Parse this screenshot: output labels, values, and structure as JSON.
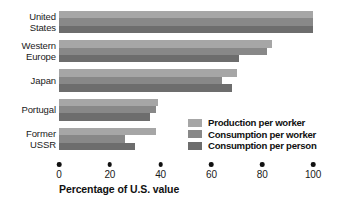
{
  "chart_data": {
    "type": "bar",
    "orientation": "horizontal",
    "title": "",
    "xlabel": "Percentage of U.S. value",
    "ylabel": "",
    "xlim": [
      0,
      100
    ],
    "xticks": [
      0,
      20,
      40,
      60,
      80,
      100
    ],
    "xtick_labels": [
      "0",
      "20",
      "40",
      "60",
      "80",
      "100"
    ],
    "grid": false,
    "legend_position": "inside-lower-right",
    "categories": [
      "United\nStates",
      "Western\nEurope",
      "Japan",
      "Portugal",
      "Former\nUSSR"
    ],
    "series": [
      {
        "name": "Production per worker",
        "color": "#a6a6a6",
        "values": [
          100,
          84,
          70,
          39,
          38
        ]
      },
      {
        "name": "Consumption per worker",
        "color": "#888888",
        "values": [
          100,
          82,
          64,
          38,
          26
        ]
      },
      {
        "name": "Consumption per person",
        "color": "#6d6d6d",
        "values": [
          100,
          71,
          68,
          36,
          30
        ]
      }
    ]
  },
  "legend": {
    "items": [
      {
        "label": "Production per worker",
        "color": "#a6a6a6"
      },
      {
        "label": "Consumption per worker",
        "color": "#888888"
      },
      {
        "label": "Consumption per person",
        "color": "#6d6d6d"
      }
    ]
  },
  "axis": {
    "title": "Percentage of U.S. value",
    "ticks": [
      "0",
      "20",
      "40",
      "60",
      "80",
      "100"
    ]
  }
}
